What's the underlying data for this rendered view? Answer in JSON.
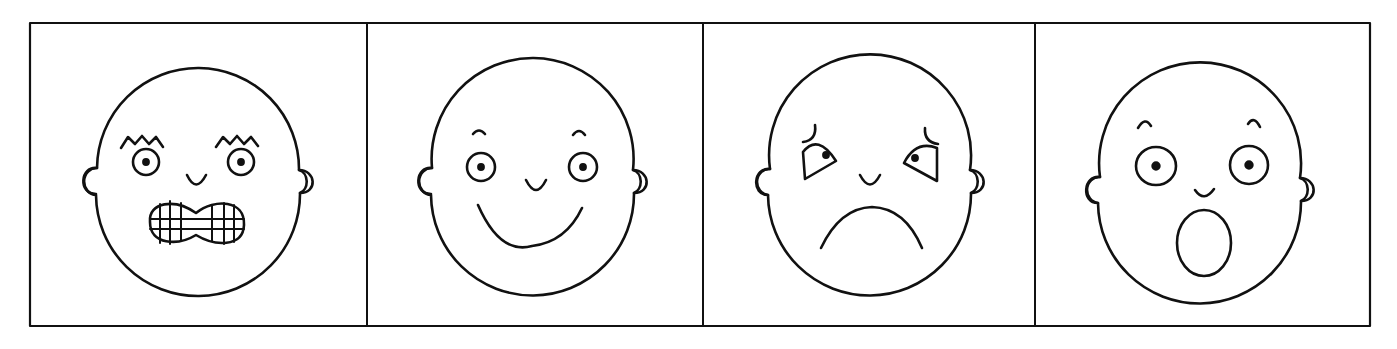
{
  "figure": {
    "stroke_color": "#111111",
    "background_color": "#ffffff",
    "panels": [
      {
        "emotion": "angry",
        "features": [
          "zigzag eyebrows",
          "round eyes with pupils",
          "small nose",
          "clenched grid teeth mouth"
        ]
      },
      {
        "emotion": "happy",
        "features": [
          "small arched eyebrows",
          "round eyes with pupils",
          "small nose",
          "wide smile"
        ]
      },
      {
        "emotion": "sad",
        "features": [
          "worried curved eyebrows",
          "drooping eyes with pupils",
          "small nose",
          "frown"
        ]
      },
      {
        "emotion": "surprised",
        "features": [
          "small arched eyebrows",
          "wide round eyes with pupils",
          "small nose",
          "open oval mouth"
        ]
      }
    ]
  }
}
